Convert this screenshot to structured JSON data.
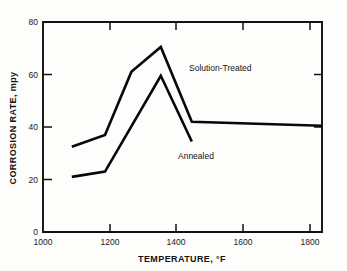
{
  "chart_data": {
    "type": "line",
    "title": "",
    "xlabel": "TEMPERATURE, °F",
    "ylabel": "CORROSION RATE, mpy",
    "xlim": [
      1000,
      1900
    ],
    "ylim": [
      0,
      80
    ],
    "xticks": [
      1000,
      1200,
      1400,
      1600,
      1800
    ],
    "xtick_labels": [
      "1000",
      "1200",
      "1400",
      "1600",
      "1800"
    ],
    "yticks": [
      0,
      20,
      40,
      60,
      80
    ],
    "ytick_labels": [
      "0",
      "20",
      "40",
      "60",
      "80"
    ],
    "grid": false,
    "legend": "inline-annotations",
    "series": [
      {
        "name": "Solution-Treated",
        "x": [
          1093,
          1200,
          1285,
          1380,
          1480,
          1900
        ],
        "values": [
          32.5,
          37.0,
          61.0,
          70.5,
          42.0,
          40.5
        ]
      },
      {
        "name": "Annealed",
        "x": [
          1093,
          1200,
          1380,
          1480
        ],
        "values": [
          21.0,
          23.0,
          59.5,
          34.5
        ]
      }
    ],
    "annotations": [
      {
        "text": "Solution-Treated",
        "x": 1500,
        "y": 60.5
      },
      {
        "text": "Annealed",
        "x": 1330,
        "y": 30.5
      }
    ],
    "colors": {
      "line": "#080808",
      "axis": "#111111",
      "background": "#fdfdfb",
      "text": "#141414"
    }
  },
  "axes": {
    "x_title": "TEMPERATURE, °F",
    "y_title": "CORROSION RATE, mpy"
  }
}
